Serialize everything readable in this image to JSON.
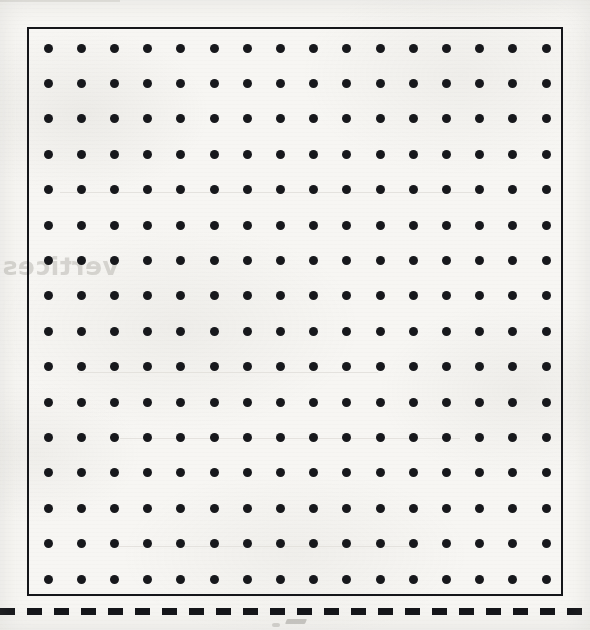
{
  "document": {
    "kind": "worksheet-dot-grid",
    "page_background_color": "#f7f6f3",
    "ink_color": "#15161a"
  },
  "grid": {
    "name": "dot-grid",
    "columns": 16,
    "rows": 16,
    "dot_diameter_px": 9,
    "spacing_x_px": 33.2,
    "spacing_y_px": 35.4,
    "origin_x_px": 19,
    "origin_y_px": 19,
    "dot_color": "#17181c",
    "border_color": "#15161a",
    "border_width_px": 2,
    "frame_left_px": 27,
    "frame_top_px": 27,
    "frame_width_px": 536,
    "frame_height_px": 569
  },
  "cut_line": {
    "label": "cut-line",
    "style": "dashed",
    "dash_length_px": 15,
    "gap_length_px": 12,
    "thickness_px": 7,
    "color": "#141519",
    "y_px": 608
  },
  "show_through": {
    "note": "mirrored ink bleeding through from the reverse side of the sheet",
    "ghost_word": "vertices",
    "ghost_color": "#c9c7c2"
  }
}
